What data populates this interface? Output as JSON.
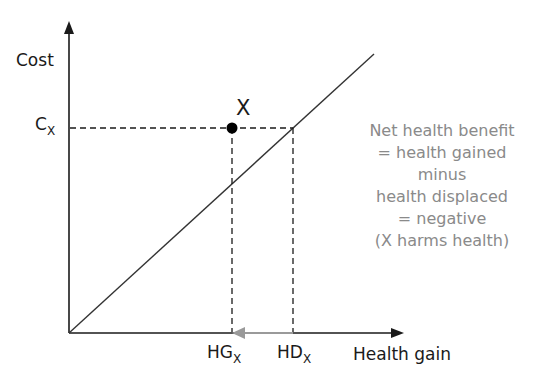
{
  "diagram": {
    "y_axis_label": "Cost",
    "x_axis_label": "Health gain",
    "cost_marker": {
      "main": "C",
      "sub": "X"
    },
    "point_label": "X",
    "hg_marker": {
      "main": "HG",
      "sub": "X"
    },
    "hd_marker": {
      "main": "HD",
      "sub": "X"
    },
    "note_lines": [
      "Net health benefit",
      "= health gained",
      "minus",
      "health displaced",
      "= negative",
      "(X harms health)"
    ],
    "colors": {
      "axis": "#1a1a1a",
      "threshold_line": "#333333",
      "arrow_gray": "#9a9a9a",
      "note_text": "#8a8a8a"
    }
  }
}
